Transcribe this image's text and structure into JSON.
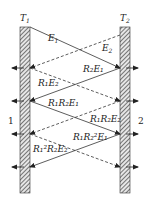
{
  "diagram": {
    "walls": {
      "left": {
        "label": "T",
        "subscript": "1",
        "side_label": "1"
      },
      "right": {
        "label": "T",
        "subscript": "2",
        "side_label": "2"
      }
    },
    "rays": [
      {
        "id": "E1",
        "style": "solid",
        "label": "E",
        "sub": "1",
        "sup": ""
      },
      {
        "id": "E2",
        "style": "dashed",
        "label": "E",
        "sub": "2",
        "sup": ""
      },
      {
        "id": "R2E1",
        "style": "solid",
        "label": "R₂E₁"
      },
      {
        "id": "R1E2",
        "style": "dashed",
        "label": "R₁E₂"
      },
      {
        "id": "R1R2E1",
        "style": "solid",
        "label": "R₁R₂E₁"
      },
      {
        "id": "R1R2E2",
        "style": "dashed",
        "label": "R₁R₂E₂"
      },
      {
        "id": "R1R2sqE1",
        "style": "solid",
        "label": "R₁R₂²E₁"
      },
      {
        "id": "R1sqR2E2",
        "style": "dashed",
        "label": "R₁²R₂E₂"
      }
    ],
    "colors": {
      "line": "#333333",
      "hatch": "#444444"
    }
  }
}
